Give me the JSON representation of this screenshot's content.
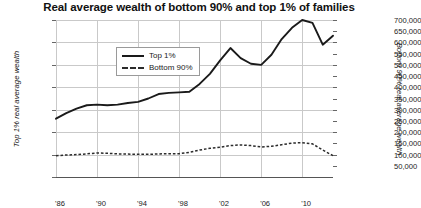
{
  "chart_data": {
    "type": "line",
    "title": "Real average wealth of bottom 90% and top 1% of families",
    "xlabel": "",
    "ylabel": "Top 1% real average wealth",
    "ylabel_right": "Bottom 90% real average wealth",
    "grid": true,
    "legend_position": "top-left-inside",
    "x": [
      1986,
      1987,
      1988,
      1989,
      1990,
      1991,
      1992,
      1993,
      1994,
      1995,
      1996,
      1997,
      1998,
      1999,
      2000,
      2001,
      2002,
      2003,
      2004,
      2005,
      2006,
      2007,
      2008,
      2009,
      2010,
      2011,
      2012,
      2013
    ],
    "xtick_labels": [
      "'86",
      "'90",
      "'94",
      "'98",
      "'02",
      "'06",
      "'10"
    ],
    "xtick_values": [
      1986,
      1990,
      1994,
      1998,
      2002,
      2006,
      2010
    ],
    "xlim": [
      1986,
      2013
    ],
    "ylim": [
      0,
      14000000
    ],
    "ytick_labels": [
      "0",
      "2,000,000",
      "4,000,000",
      "6,000,000",
      "8,000,000",
      "10,000,000",
      "12,000,000",
      "14,000,000"
    ],
    "ytick_values": [
      0,
      2000000,
      4000000,
      6000000,
      8000000,
      10000000,
      12000000,
      14000000
    ],
    "ylim_right": [
      0,
      700000
    ],
    "ytick_labels_right": [
      "50,000",
      "100,000",
      "150,000",
      "200,000",
      "250,000",
      "300,000",
      "350,000",
      "400,000",
      "450,000",
      "500,000",
      "550,000",
      "600,000",
      "650,000",
      "700,000"
    ],
    "ytick_values_right": [
      50000,
      100000,
      150000,
      200000,
      250000,
      300000,
      350000,
      400000,
      450000,
      500000,
      550000,
      600000,
      650000,
      700000
    ],
    "series": [
      {
        "name": "Top 1%",
        "axis": "left",
        "style": "solid",
        "color": "#1a1a1a",
        "values": [
          5200000,
          5700000,
          6100000,
          6400000,
          6450000,
          6400000,
          6450000,
          6600000,
          6700000,
          7000000,
          7400000,
          7500000,
          7550000,
          7600000,
          8300000,
          9200000,
          10400000,
          11500000,
          10600000,
          10100000,
          10000000,
          10900000,
          12300000,
          13300000,
          14000000,
          13750000,
          11800000,
          12600000
        ]
      },
      {
        "name": "Bottom 90%",
        "axis": "right",
        "style": "dotted",
        "color": "#2b2b2b",
        "values": [
          95000,
          98000,
          100000,
          103000,
          107000,
          106000,
          103000,
          102000,
          101000,
          101000,
          103000,
          104000,
          104000,
          110000,
          120000,
          128000,
          133000,
          140000,
          143000,
          140000,
          134000,
          137000,
          144000,
          151000,
          153000,
          148000,
          120000,
          95000
        ]
      }
    ]
  },
  "legend": {
    "items": [
      {
        "label": "Top 1%",
        "style": "solid"
      },
      {
        "label": "Bottom 90%",
        "style": "dotted"
      }
    ]
  }
}
